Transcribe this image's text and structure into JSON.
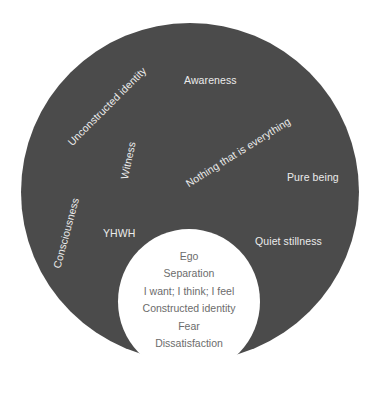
{
  "diagram": {
    "type": "nested-circles",
    "colors": {
      "outer_circle": "#4b4b4b",
      "outer_text": "#ececec",
      "inner_circle": "#ffffff",
      "inner_text": "#6c6c6c",
      "background": "#ffffff"
    },
    "outer": {
      "labels": [
        {
          "text": "Awareness",
          "rotation": 0
        },
        {
          "text": "Unconstructed identity",
          "rotation": -45
        },
        {
          "text": "Witness",
          "rotation": -78
        },
        {
          "text": "Nothing that is everything",
          "rotation": -32
        },
        {
          "text": "Pure being",
          "rotation": 0
        },
        {
          "text": "Consciousness",
          "rotation": -75
        },
        {
          "text": "YHWH",
          "rotation": 0
        },
        {
          "text": "Quiet stillness",
          "rotation": 0
        }
      ]
    },
    "inner": {
      "items": [
        "Ego",
        "Separation",
        "I want; I think; I feel",
        "Constructed identity",
        "Fear",
        "Dissatisfaction"
      ]
    }
  }
}
